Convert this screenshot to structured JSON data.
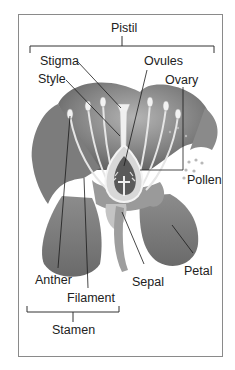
{
  "diagram": {
    "groups": {
      "pistil": {
        "label": "Pistil",
        "members": [
          "Stigma",
          "Style",
          "Ovary",
          "Ovules"
        ]
      },
      "stamen": {
        "label": "Stamen",
        "members": [
          "Anther",
          "Filament"
        ]
      }
    },
    "labels": {
      "stigma": "Stigma",
      "style": "Style",
      "ovules": "Ovules",
      "ovary": "Ovary",
      "pollen": "Pollen",
      "anther": "Anther",
      "filament": "Filament",
      "sepal": "Sepal",
      "petal": "Petal"
    },
    "colors": {
      "frame": "#8a8a8a",
      "line": "#1a1a1a",
      "petal_dark": "#6e6e6e",
      "petal_light": "#a8a8a8",
      "stamen": "#e8e8e8",
      "pollen": "#b8b8b8"
    }
  }
}
